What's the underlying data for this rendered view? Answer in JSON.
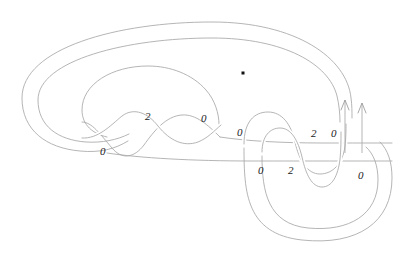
{
  "figure": {
    "kind": "knot-link-diagram",
    "background_color": "#ffffff",
    "strand_color": "#a8a8a8",
    "label_color": "#1a1a1a",
    "basepoint_color": "#111111",
    "width": 417,
    "height": 259
  },
  "basepoint": {
    "name": "basepoint-dot",
    "x": 243,
    "y": 73
  },
  "arrows": [
    {
      "name": "orientation-arrow-left",
      "x": 345,
      "y_tail": 152,
      "y_head": 100,
      "direction": "up"
    },
    {
      "name": "orientation-arrow-right",
      "x": 362,
      "y_tail": 152,
      "y_head": 102,
      "direction": "up"
    }
  ],
  "labels": [
    {
      "id": "label-left-0",
      "text": "0",
      "x": 100,
      "y": 146
    },
    {
      "id": "label-left-2",
      "text": "2",
      "x": 145,
      "y": 115
    },
    {
      "id": "label-left-0-right",
      "text": "0",
      "x": 201,
      "y": 117
    },
    {
      "id": "label-mid-0",
      "text": "0",
      "x": 237,
      "y": 130
    },
    {
      "id": "label-right-2-top",
      "text": "2",
      "x": 311,
      "y": 132
    },
    {
      "id": "label-right-0-top",
      "text": "0",
      "x": 331,
      "y": 132
    },
    {
      "id": "label-bottom-0-left",
      "text": "0",
      "x": 258,
      "y": 168
    },
    {
      "id": "label-bottom-2",
      "text": "2",
      "x": 288,
      "y": 168
    },
    {
      "id": "label-bottom-0-right",
      "text": "0",
      "x": 358,
      "y": 173
    }
  ],
  "strand_paths": [
    {
      "id": "outer-loop-1",
      "d": "M 352 118 C 352 58, 300 22, 215 22 C 120 22, 24 46, 24 96 C 24 128, 45 146, 78 150 C 100 152, 118 148, 130 140"
    },
    {
      "id": "outer-loop-2",
      "d": "M 340 122 C 340 70, 292 38, 215 38 C 130 38, 40 58, 40 98 C 40 124, 58 138, 86 141 C 104 143, 120 140, 132 133"
    },
    {
      "id": "inner-loop-3",
      "d": "M 218 122 C 218 88, 186 64, 148 64 C 110 64, 80 82, 80 108 C 80 124, 92 134, 106 137"
    },
    {
      "id": "wave-left-a",
      "d": "M 88 125 C 100 125, 110 140, 122 152 C 134 163, 146 155, 156 140 C 166 125, 176 112, 190 114 C 204 116, 212 128, 222 138"
    },
    {
      "id": "wave-left-b",
      "d": "M 88 137 C 104 137, 116 122, 128 114 C 140 106, 152 114, 162 126 C 172 138, 184 144, 198 140 C 210 136, 216 128, 222 124"
    },
    {
      "id": "bridge-upper",
      "d": "M 222 138 C 246 142, 280 143, 320 143 C 352 143, 372 143, 390 143"
    },
    {
      "id": "bridge-lower",
      "d": "M 106 154 C 140 158, 190 160, 250 160 C 310 160, 350 160, 392 160"
    },
    {
      "id": "right-wave-top",
      "d": "M 244 140 C 244 120, 254 110, 268 110 C 282 110, 290 122, 294 140 C 298 158, 306 172, 320 172 C 334 172, 344 162, 346 146"
    },
    {
      "id": "right-wave-bot",
      "d": "M 262 150 C 262 134, 270 126, 281 126 C 292 126, 298 138, 302 156 C 306 174, 312 186, 322 186 C 332 186, 338 176, 340 158"
    },
    {
      "id": "right-outer-1",
      "d": "M 244 146 C 244 190, 246 232, 300 238 C 356 244, 390 222, 390 178 C 390 160, 386 148, 378 140"
    },
    {
      "id": "right-outer-2",
      "d": "M 262 152 C 262 190, 266 222, 306 226 C 348 230, 376 214, 376 180 C 376 164, 372 152, 364 145"
    }
  ]
}
